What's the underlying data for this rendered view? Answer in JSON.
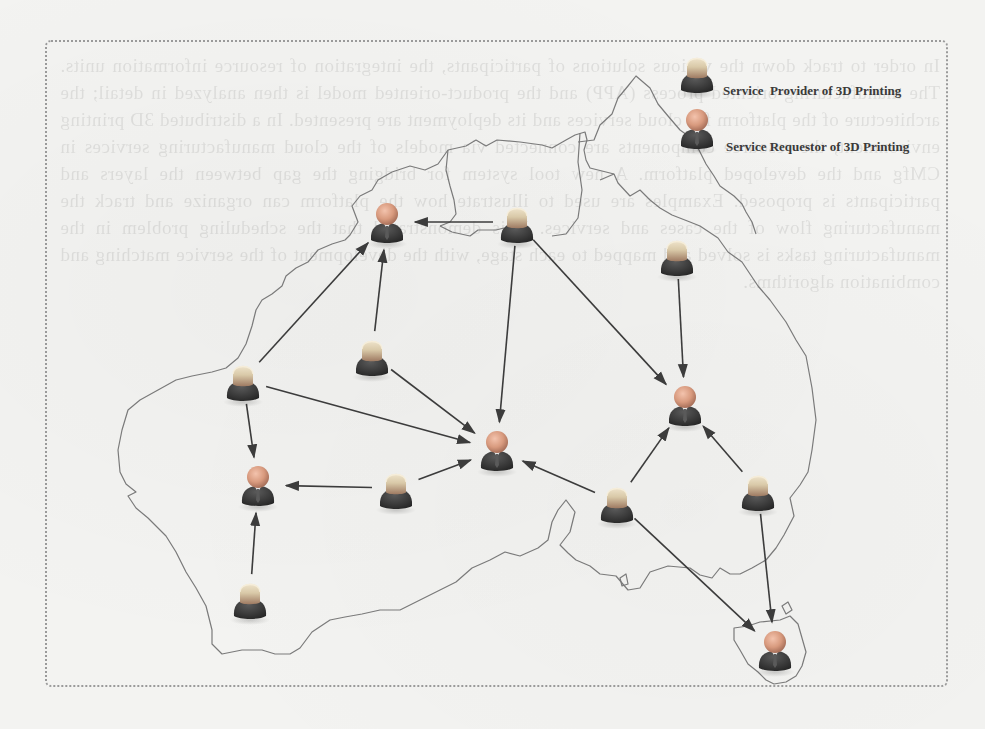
{
  "legend": {
    "provider_label": "Service  Provider of 3D Printing",
    "requestor_label": "Service Requestor of 3D Printing"
  },
  "map": {
    "region": "Australia (outline)"
  },
  "colors": {
    "arrow": "#3c3c3c",
    "map_outline": "#7a7a7a",
    "provider_head": "#d9c9a8",
    "requestor_head": "#d89a7e",
    "body": "#3b3b3b",
    "frame_border": "#9a9a9a"
  },
  "nodes": [
    {
      "id": "R1",
      "type": "requestor",
      "x": 387,
      "y": 222
    },
    {
      "id": "R2",
      "type": "requestor",
      "x": 497,
      "y": 450
    },
    {
      "id": "R3",
      "type": "requestor",
      "x": 685,
      "y": 405
    },
    {
      "id": "R4",
      "type": "requestor",
      "x": 258,
      "y": 485
    },
    {
      "id": "R5",
      "type": "requestor",
      "x": 775,
      "y": 650
    },
    {
      "id": "P1",
      "type": "provider",
      "x": 517,
      "y": 222
    },
    {
      "id": "P2",
      "type": "provider",
      "x": 677,
      "y": 255
    },
    {
      "id": "P3",
      "type": "provider",
      "x": 372,
      "y": 355
    },
    {
      "id": "P4",
      "type": "provider",
      "x": 243,
      "y": 380
    },
    {
      "id": "P5",
      "type": "provider",
      "x": 396,
      "y": 488
    },
    {
      "id": "P6",
      "type": "provider",
      "x": 617,
      "y": 502
    },
    {
      "id": "P7",
      "type": "provider",
      "x": 758,
      "y": 490
    },
    {
      "id": "P8",
      "type": "provider",
      "x": 250,
      "y": 598
    }
  ],
  "edges": [
    {
      "from": "P1",
      "to": "R1"
    },
    {
      "from": "P1",
      "to": "R2"
    },
    {
      "from": "P1",
      "to": "R3"
    },
    {
      "from": "P2",
      "to": "R3"
    },
    {
      "from": "P3",
      "to": "R1"
    },
    {
      "from": "P3",
      "to": "R2"
    },
    {
      "from": "P4",
      "to": "R1"
    },
    {
      "from": "P4",
      "to": "R2"
    },
    {
      "from": "P4",
      "to": "R4"
    },
    {
      "from": "P5",
      "to": "R2"
    },
    {
      "from": "P5",
      "to": "R4"
    },
    {
      "from": "P6",
      "to": "R2"
    },
    {
      "from": "P6",
      "to": "R3"
    },
    {
      "from": "P6",
      "to": "R5"
    },
    {
      "from": "P7",
      "to": "R3"
    },
    {
      "from": "P7",
      "to": "R5"
    },
    {
      "from": "P8",
      "to": "R4"
    }
  ],
  "ghost_text": "In order to track down the various solutions of participants, the integration of resource information units. The manufacturing-oriented process (APP) and the product-oriented model is then analyzed in detail; the architecture of the platform for cloud services and its deployment are presented. In a distributed 3D printing environment, the resource components are connected via models of the cloud manufacturing services in CMfg and the developed platform. A new tool system for bridging the gap between the layers and participants is proposed. Examples are used to illustrate how the platform can organize and track the manufacturing flow of the cases and services. It is demonstrated that the scheduling problem in the manufacturing tasks is solved and mapped to each stage, with the development of the service matching and combination algorithms."
}
